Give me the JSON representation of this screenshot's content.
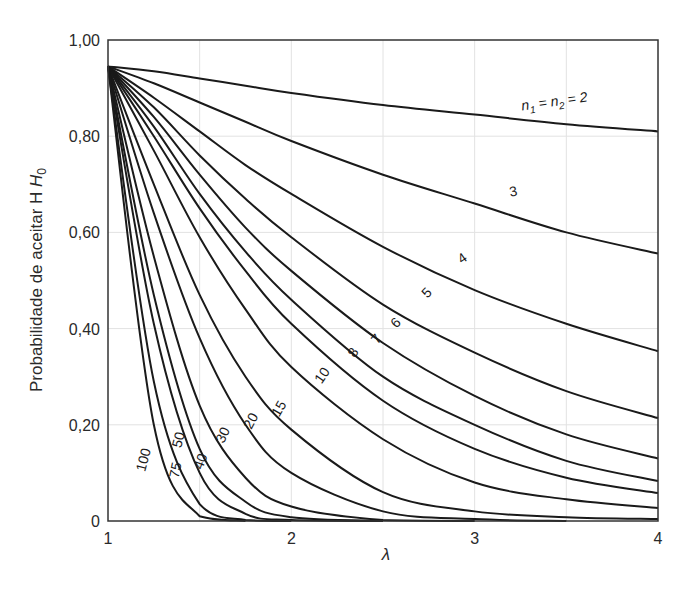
{
  "chart_data": {
    "type": "line",
    "title": "",
    "xlabel": "λ",
    "ylabel": "Probabilidade de aceitar H",
    "ylabel_subscript": "0",
    "xlim": [
      1,
      4
    ],
    "ylim": [
      0,
      1.0
    ],
    "xticks": [
      "1",
      "2",
      "3",
      "4"
    ],
    "yticks": [
      "0",
      "0,20",
      "0,40",
      "0,60",
      "0,80",
      "1,00"
    ],
    "grid": true,
    "legend": "inline curve labels",
    "x": [
      1.0,
      1.25,
      1.5,
      1.75,
      2.0,
      2.5,
      3.0,
      3.5,
      4.0
    ],
    "series": [
      {
        "name": "n1 = n2 = 2",
        "label": "n₁ = n₂ = 2",
        "values": [
          0.945,
          0.935,
          0.92,
          0.905,
          0.89,
          0.865,
          0.845,
          0.825,
          0.81
        ]
      },
      {
        "name": "3",
        "label": "3",
        "values": [
          0.945,
          0.91,
          0.87,
          0.83,
          0.79,
          0.72,
          0.66,
          0.6,
          0.556
        ]
      },
      {
        "name": "4",
        "label": "4",
        "values": [
          0.945,
          0.88,
          0.81,
          0.74,
          0.68,
          0.57,
          0.48,
          0.41,
          0.353
        ]
      },
      {
        "name": "5",
        "label": "5",
        "values": [
          0.945,
          0.86,
          0.76,
          0.67,
          0.59,
          0.45,
          0.35,
          0.27,
          0.214
        ]
      },
      {
        "name": "6",
        "label": "6",
        "values": [
          0.945,
          0.84,
          0.72,
          0.61,
          0.52,
          0.37,
          0.26,
          0.18,
          0.13
        ]
      },
      {
        "name": "7",
        "label": "7",
        "values": [
          0.945,
          0.82,
          0.68,
          0.56,
          0.46,
          0.3,
          0.2,
          0.125,
          0.083
        ]
      },
      {
        "name": "8",
        "label": "8",
        "values": [
          0.945,
          0.8,
          0.65,
          0.52,
          0.41,
          0.25,
          0.15,
          0.09,
          0.058
        ]
      },
      {
        "name": "10",
        "label": "10",
        "values": [
          0.945,
          0.77,
          0.59,
          0.44,
          0.32,
          0.17,
          0.08,
          0.045,
          0.027
        ]
      },
      {
        "name": "15",
        "label": "15",
        "values": [
          0.945,
          0.7,
          0.47,
          0.3,
          0.19,
          0.06,
          0.02,
          0.008,
          0.004
        ]
      },
      {
        "name": "20",
        "label": "20",
        "values": [
          0.945,
          0.64,
          0.38,
          0.2,
          0.1,
          0.02,
          0.004,
          0.0,
          0.0
        ]
      },
      {
        "name": "30",
        "label": "30",
        "values": [
          0.945,
          0.55,
          0.24,
          0.09,
          0.03,
          0.002,
          0.0,
          0.0,
          0.0
        ]
      },
      {
        "name": "40",
        "label": "40",
        "values": [
          0.945,
          0.47,
          0.15,
          0.04,
          0.008,
          0.0,
          0.0,
          0.0,
          0.0
        ]
      },
      {
        "name": "50",
        "label": "50",
        "values": [
          0.945,
          0.41,
          0.1,
          0.015,
          0.002,
          0.0,
          0.0,
          0.0,
          0.0
        ]
      },
      {
        "name": "75",
        "label": "75",
        "values": [
          0.945,
          0.29,
          0.035,
          0.002,
          0.0,
          0.0,
          0.0,
          0.0,
          0.0
        ]
      },
      {
        "name": "100",
        "label": "100",
        "values": [
          0.945,
          0.2,
          0.01,
          0.0,
          0.0,
          0.0,
          0.0,
          0.0,
          0.0
        ]
      }
    ]
  }
}
